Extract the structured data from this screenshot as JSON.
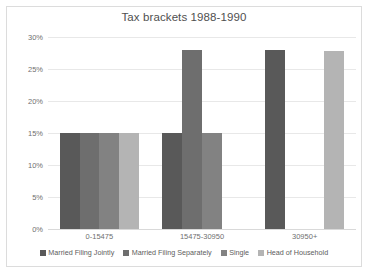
{
  "chart_data": {
    "type": "bar",
    "title": "Tax brackets 1988-1990",
    "xlabel": "",
    "ylabel": "",
    "categories": [
      "0-15475",
      "15475-30950",
      "30950+"
    ],
    "series": [
      {
        "name": "Married Filing Jointly",
        "color": "#595959",
        "values": [
          15,
          15,
          28
        ]
      },
      {
        "name": "Married Filing Separately",
        "color": "#6e6e6e",
        "values": [
          15,
          28,
          0
        ]
      },
      {
        "name": "Single",
        "color": "#828282",
        "values": [
          15,
          15,
          0
        ]
      },
      {
        "name": "Head of Household",
        "color": "#b4b4b4",
        "values": [
          15,
          0,
          27.8
        ]
      }
    ],
    "ylim": [
      0,
      30
    ],
    "yticks": [
      0,
      5,
      10,
      15,
      20,
      25,
      30
    ],
    "ytick_labels": [
      "0%",
      "5%",
      "10%",
      "15%",
      "20%",
      "25%",
      "30%"
    ],
    "grid": true,
    "legend_position": "bottom"
  }
}
